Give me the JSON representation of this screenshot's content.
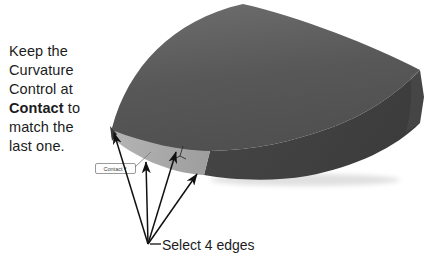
{
  "instruction": {
    "line1": "Keep the",
    "line2": "Curvature",
    "line3": "Control at",
    "line4_bold": "Contact",
    "line4_rest": " to",
    "line5": "match the",
    "line6": "last one."
  },
  "callout": {
    "label": "Contact",
    "dropdown_glyph": "▾"
  },
  "annotation": {
    "label": "Select 4 edges",
    "edge_count": 4
  },
  "icons": {
    "triad": "triad-icon",
    "dropdown": "dropdown-arrow-icon"
  },
  "colors": {
    "background": "#ffffff",
    "top_surface": "#585858",
    "top_surface_light": "#6e6e6e",
    "front_face": "#474747",
    "front_face_dark": "#3c3c3c",
    "band": "#9d9d9d",
    "band_light": "#b5b5b5",
    "sliver": "#3a3a3a",
    "arrow": "#111111",
    "text": "#1c1c1c"
  }
}
